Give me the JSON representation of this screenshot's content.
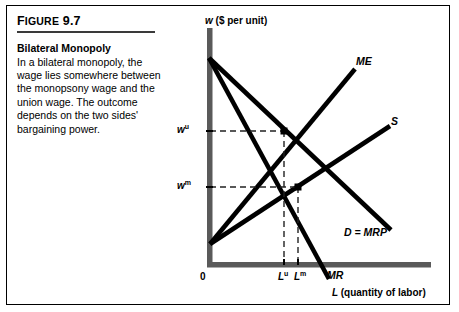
{
  "figure": {
    "number": "FIGURE 9.7",
    "title": "Bilateral Monopoly",
    "body": "In a bilateral monopoly, the wage lies somewhere between the monopsony wage and the union wage. The outcome depends on the two sides' bargaining power."
  },
  "chart_data": {
    "type": "line",
    "title": "Bilateral Monopoly",
    "xlabel": "L (quantity of labor)",
    "ylabel": "w ($ per unit)",
    "xlabel_symbol": "L",
    "xlabel_unit": "(quantity of labor)",
    "ylabel_symbol": "w",
    "ylabel_unit": "($ per unit)",
    "grid": false,
    "legend": "inline-curve-labels",
    "xlim": [
      0,
      10
    ],
    "ylim": [
      0,
      10
    ],
    "axis_origin_label": "0",
    "series": [
      {
        "name": "D = MRP",
        "label": "D = MRP",
        "description": "Demand / marginal revenue product, downward sloping",
        "points": [
          [
            0,
            8.6
          ],
          [
            7.6,
            1.4
          ]
        ]
      },
      {
        "name": "MR",
        "label": "MR",
        "description": "Marginal revenue, steeper downward sloping from same intercept",
        "points": [
          [
            0,
            8.6
          ],
          [
            5.4,
            0.0
          ]
        ]
      },
      {
        "name": "S",
        "label": "S",
        "description": "Labor supply curve, upward sloping",
        "points": [
          [
            0,
            0.8
          ],
          [
            8.9,
            6.6
          ]
        ]
      },
      {
        "name": "ME",
        "label": "ME",
        "description": "Marginal expenditure, steeper upward sloping from same intercept",
        "points": [
          [
            0,
            0.8
          ],
          [
            6.6,
            9.0
          ]
        ]
      }
    ],
    "y_ticks": [
      {
        "label": "w",
        "sup": "u",
        "value": 5.9,
        "description": "union wage"
      },
      {
        "label": "w",
        "sup": "m",
        "value": 3.05,
        "description": "monopsony wage"
      }
    ],
    "x_ticks": [
      {
        "label": "L",
        "sup": "u",
        "value": 3.35,
        "description": "union employment level"
      },
      {
        "label": "L",
        "sup": "m",
        "value": 3.95,
        "description": "monopsony employment level"
      }
    ],
    "annotations": [
      {
        "name": "union-equilibrium-point",
        "description": "Intersection of ME and D = MRP at w-u, L-u",
        "x": 3.35,
        "y": 5.9
      },
      {
        "name": "monopsony-equilibrium-point",
        "description": "Point on S above L-m at the monopsony wage w-m",
        "x": 3.95,
        "y": 3.05
      }
    ]
  },
  "colors": {
    "curve": "#000000",
    "axis": "#555555",
    "dashed_guide": "#333333",
    "frame": "#000000",
    "rule": "#3a3a3a"
  }
}
